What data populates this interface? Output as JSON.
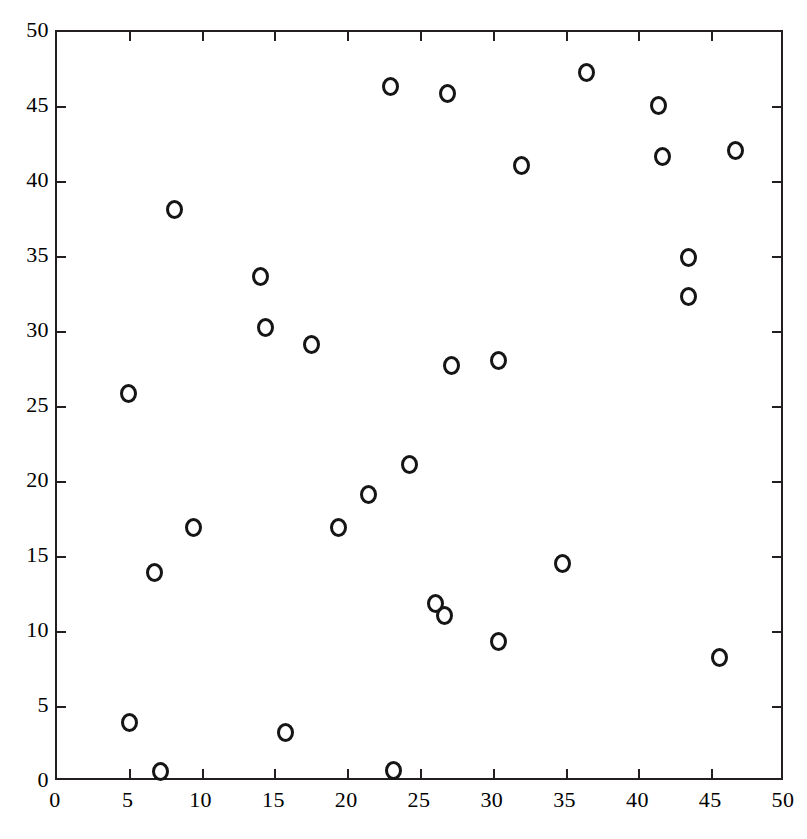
{
  "chart_data": {
    "type": "scatter",
    "title": "",
    "subtitle": "",
    "xlabel": "",
    "ylabel": "",
    "xlim": [
      0,
      50
    ],
    "ylim": [
      0,
      50
    ],
    "xticks": [
      0,
      5,
      10,
      15,
      20,
      25,
      30,
      35,
      40,
      45,
      50
    ],
    "yticks": [
      0,
      5,
      10,
      15,
      20,
      25,
      30,
      35,
      40,
      45,
      50
    ],
    "xtick_labels": [
      "0",
      "5",
      "10",
      "15",
      "20",
      "25",
      "30",
      "35",
      "40",
      "45",
      "50"
    ],
    "ytick_labels": [
      "0",
      "5",
      "10",
      "15",
      "20",
      "25",
      "30",
      "35",
      "40",
      "45",
      "50"
    ],
    "grid": false,
    "legend": null,
    "marker_style": "open-circle",
    "marker_color": "#151515",
    "n_points": 28,
    "points": [
      {
        "x": 4.9,
        "y": 25.9
      },
      {
        "x": 5.0,
        "y": 4.0
      },
      {
        "x": 6.7,
        "y": 14.0
      },
      {
        "x": 7.1,
        "y": 0.7
      },
      {
        "x": 8.1,
        "y": 38.2
      },
      {
        "x": 9.4,
        "y": 17.0
      },
      {
        "x": 14.0,
        "y": 33.7
      },
      {
        "x": 14.3,
        "y": 30.3
      },
      {
        "x": 15.7,
        "y": 3.3
      },
      {
        "x": 17.5,
        "y": 29.2
      },
      {
        "x": 19.3,
        "y": 17.0
      },
      {
        "x": 21.4,
        "y": 19.2
      },
      {
        "x": 22.9,
        "y": 46.4
      },
      {
        "x": 23.1,
        "y": 0.8
      },
      {
        "x": 24.2,
        "y": 21.2
      },
      {
        "x": 26.0,
        "y": 11.9
      },
      {
        "x": 26.6,
        "y": 11.1
      },
      {
        "x": 26.8,
        "y": 45.9
      },
      {
        "x": 27.1,
        "y": 27.8
      },
      {
        "x": 30.3,
        "y": 9.4
      },
      {
        "x": 30.3,
        "y": 28.1
      },
      {
        "x": 31.9,
        "y": 41.1
      },
      {
        "x": 34.7,
        "y": 14.6
      },
      {
        "x": 36.4,
        "y": 47.3
      },
      {
        "x": 41.3,
        "y": 45.1
      },
      {
        "x": 41.6,
        "y": 41.7
      },
      {
        "x": 43.4,
        "y": 35.0
      },
      {
        "x": 43.4,
        "y": 32.4
      },
      {
        "x": 45.5,
        "y": 8.3
      },
      {
        "x": 46.6,
        "y": 42.1
      }
    ]
  }
}
